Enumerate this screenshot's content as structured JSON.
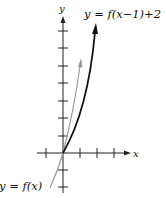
{
  "diagram": {
    "axes": {
      "x_label": "x",
      "y_label": "y"
    },
    "curves": [
      {
        "name": "shifted",
        "label": "y = f(x−1)+2",
        "color": "#111111"
      },
      {
        "name": "original",
        "label": "y = f(x)",
        "color": "#9a9a9a"
      }
    ]
  }
}
